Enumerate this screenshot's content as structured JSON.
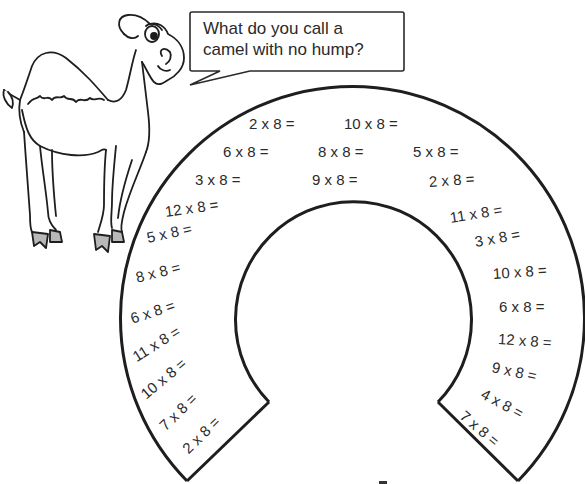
{
  "worksheet": {
    "title_question": {
      "line1": "What do you call a",
      "line2": "camel with no hump?"
    },
    "illustration": "camel-cartoon",
    "shape": "horseshoe-arc",
    "colors": {
      "line": "#1e1e1e",
      "hoof_fill": "#b8b8b8",
      "background": "#ffffff"
    },
    "problems": [
      {
        "id": 1,
        "text": "2 x 8 =",
        "x": 249,
        "y": 124,
        "rot": 0
      },
      {
        "id": 2,
        "text": "10 x 8 =",
        "x": 344,
        "y": 124,
        "rot": 0
      },
      {
        "id": 3,
        "text": "6 x 8 =",
        "x": 223,
        "y": 152,
        "rot": 0
      },
      {
        "id": 4,
        "text": "8 x 8 =",
        "x": 318,
        "y": 152,
        "rot": 0
      },
      {
        "id": 5,
        "text": "5 x 8 =",
        "x": 413,
        "y": 152,
        "rot": 0
      },
      {
        "id": 6,
        "text": "3 x 8 =",
        "x": 195,
        "y": 180,
        "rot": 0
      },
      {
        "id": 7,
        "text": "9 x 8 =",
        "x": 312,
        "y": 180,
        "rot": 0
      },
      {
        "id": 8,
        "text": "2 x 8 =",
        "x": 429,
        "y": 182,
        "rot": -4
      },
      {
        "id": 9,
        "text": "12 x 8 =",
        "x": 165,
        "y": 212,
        "rot": -8
      },
      {
        "id": 10,
        "text": "5 x 8 =",
        "x": 147,
        "y": 238,
        "rot": -12
      },
      {
        "id": 11,
        "text": "8 x 8 =",
        "x": 136,
        "y": 278,
        "rot": -14
      },
      {
        "id": 12,
        "text": "6 x 8 =",
        "x": 131,
        "y": 319,
        "rot": -18
      },
      {
        "id": 13,
        "text": "11 x 8 =",
        "x": 134,
        "y": 358,
        "rot": -32
      },
      {
        "id": 14,
        "text": "10 x 8 =",
        "x": 143,
        "y": 396,
        "rot": -40
      },
      {
        "id": 15,
        "text": "7 x 8 =",
        "x": 162,
        "y": 428,
        "rot": -44
      },
      {
        "id": 16,
        "text": "2 x 8 =",
        "x": 185,
        "y": 451,
        "rot": -44
      },
      {
        "id": 17,
        "text": "11 x 8 =",
        "x": 450,
        "y": 218,
        "rot": -9
      },
      {
        "id": 18,
        "text": "3 x 8 =",
        "x": 475,
        "y": 242,
        "rot": -10
      },
      {
        "id": 19,
        "text": "10 x 8 =",
        "x": 493,
        "y": 274,
        "rot": -4
      },
      {
        "id": 20,
        "text": "6 x 8 =",
        "x": 499,
        "y": 307,
        "rot": 0
      },
      {
        "id": 21,
        "text": "12 x 8 =",
        "x": 498,
        "y": 339,
        "rot": 4
      },
      {
        "id": 22,
        "text": "9 x 8 =",
        "x": 492,
        "y": 367,
        "rot": 12
      },
      {
        "id": 23,
        "text": "4 x 8 =",
        "x": 482,
        "y": 393,
        "rot": 28
      },
      {
        "id": 24,
        "text": "7 x 8 =",
        "x": 462,
        "y": 414,
        "rot": 40
      }
    ]
  }
}
